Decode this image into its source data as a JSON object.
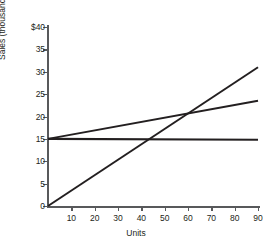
{
  "chart_data": {
    "type": "line",
    "title": "",
    "xlabel": "Units",
    "ylabel": "Sales (thousands omitted)",
    "xlim": [
      0,
      90
    ],
    "ylim": [
      0,
      40
    ],
    "grid": false,
    "legend": "none",
    "x_ticks": [
      {
        "value": 10,
        "label": "10"
      },
      {
        "value": 20,
        "label": "20"
      },
      {
        "value": 30,
        "label": "30"
      },
      {
        "value": 40,
        "label": "40"
      },
      {
        "value": 50,
        "label": "50"
      },
      {
        "value": 60,
        "label": "60"
      },
      {
        "value": 70,
        "label": "70"
      },
      {
        "value": 80,
        "label": "80"
      },
      {
        "value": 90,
        "label": "90"
      }
    ],
    "y_ticks": [
      {
        "value": 0,
        "label": "0"
      },
      {
        "value": 5,
        "label": "5"
      },
      {
        "value": 10,
        "label": "10"
      },
      {
        "value": 15,
        "label": "15"
      },
      {
        "value": 20,
        "label": "20"
      },
      {
        "value": 25,
        "label": "25"
      },
      {
        "value": 30,
        "label": "30"
      },
      {
        "value": 35,
        "label": "35"
      },
      {
        "value": 40,
        "label": "$40"
      }
    ],
    "series": [
      {
        "name": "steep-line",
        "points": [
          [
            0,
            0
          ],
          [
            90,
            31
          ]
        ],
        "color": "#231f20",
        "width": 2.0
      },
      {
        "name": "moderate-line",
        "points": [
          [
            0,
            15
          ],
          [
            90,
            23.5
          ]
        ],
        "color": "#231f20",
        "width": 2.0
      },
      {
        "name": "flat-line",
        "points": [
          [
            0,
            15
          ],
          [
            90,
            14.8
          ]
        ],
        "color": "#231f20",
        "width": 2.2
      }
    ],
    "axis_color": "#58595b"
  }
}
